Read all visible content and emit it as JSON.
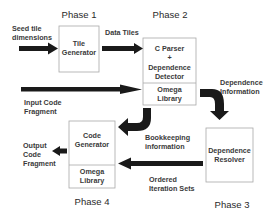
{
  "phases": {
    "p1": "Phase 1",
    "p2": "Phase 2",
    "p3": "Phase 3",
    "p4": "Phase 4"
  },
  "boxes": {
    "tile_generator": {
      "line1": "Tile",
      "line2": "Generator"
    },
    "parser": {
      "line1": "C Parser",
      "line2": "+",
      "line3": "Dependence",
      "line4": "Detector"
    },
    "omega_top": {
      "line1": "Omega",
      "line2": "Library"
    },
    "code_generator": {
      "line1": "Code",
      "line2": "Generator"
    },
    "omega_bottom": {
      "line1": "Omega",
      "line2": "Library"
    },
    "resolver": {
      "line1": "Dependence",
      "line2": "Resolver"
    }
  },
  "labels": {
    "seed": {
      "line1": "Seed tile",
      "line2": "dimensions"
    },
    "data_tiles": "Data Tiles",
    "input_code": {
      "line1": "Input Code",
      "line2": "Fragment"
    },
    "dependence_info": {
      "line1": "Dependence",
      "line2": "Information"
    },
    "bookkeeping": {
      "line1": "Bookkeeping",
      "line2": "information"
    },
    "ordered": {
      "line1": "Ordered",
      "line2": "Iteration Sets"
    },
    "output_code": {
      "line1": "Output",
      "line2": "Code",
      "line3": "Fragment"
    }
  },
  "colors": {
    "arrow": "#1a1a1a",
    "box_border": "#a8a8a8",
    "text": "#3a3a3a"
  }
}
